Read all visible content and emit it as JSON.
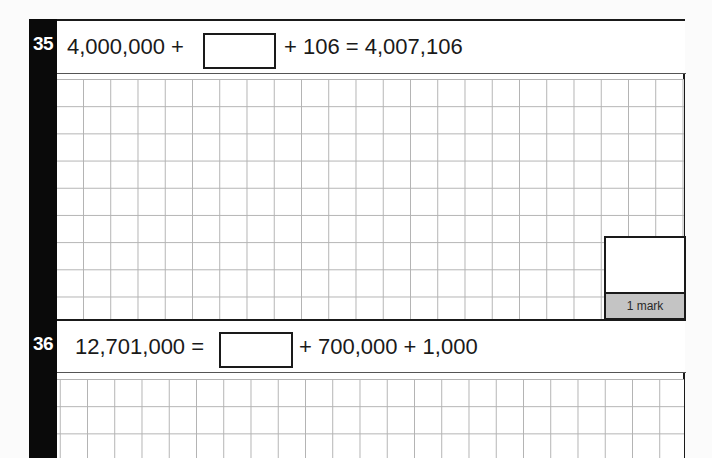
{
  "questions": [
    {
      "number": "35",
      "equation_left": "4,000,000 +",
      "equation_right": "+ 106 = 4,007,106",
      "answer_value": "",
      "marks_label": "1 mark"
    },
    {
      "number": "36",
      "equation_left": "12,701,000 =",
      "equation_right": "+ 700,000 + 1,000",
      "answer_value": ""
    }
  ],
  "colors": {
    "question_bar": "#0a0a0a",
    "grid_line": "#b3b3b3",
    "mark_strip": "#c4c4c4",
    "border": "#1a1a1a"
  }
}
